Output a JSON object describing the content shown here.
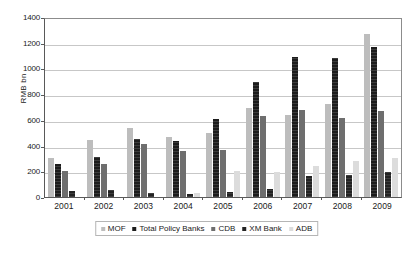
{
  "chart_data": {
    "type": "bar",
    "title": "",
    "subtitle": "",
    "xlabel": "",
    "ylabel": "RMB bn",
    "ylim": [
      0,
      1400
    ],
    "ytick_step": 200,
    "yticks": [
      "1400",
      "1200",
      "1000",
      "800",
      "600",
      "400",
      "200",
      "0"
    ],
    "grid": true,
    "legend_position": "bottom",
    "categories": [
      "2001",
      "2002",
      "2003",
      "2004",
      "2005",
      "2006",
      "2007",
      "2008",
      "2009"
    ],
    "series": [
      {
        "name": "MOF",
        "color": "#bdbdbd",
        "values": [
          300,
          440,
          540,
          470,
          500,
          690,
          635,
          720,
          1265
        ]
      },
      {
        "name": "Total Policy Banks",
        "color": "#1c1c1c",
        "values": [
          255,
          312,
          448,
          432,
          605,
          895,
          1090,
          1080,
          1168
        ]
      },
      {
        "name": "CDB",
        "color": "#6e6e6e",
        "values": [
          205,
          255,
          415,
          358,
          362,
          628,
          675,
          618,
          668
        ]
      },
      {
        "name": "XM Bank",
        "color": "#232323",
        "values": [
          48,
          55,
          28,
          26,
          38,
          65,
          160,
          175,
          195
        ]
      },
      {
        "name": "ADB",
        "color": "#dcdcdc",
        "values": [
          0,
          0,
          0,
          32,
          200,
          198,
          242,
          278,
          300
        ]
      }
    ]
  },
  "legend": {
    "items": [
      {
        "label": "MOF"
      },
      {
        "label": "Total Policy Banks"
      },
      {
        "label": "CDB"
      },
      {
        "label": "XM Bank"
      },
      {
        "label": "ADB"
      }
    ]
  }
}
